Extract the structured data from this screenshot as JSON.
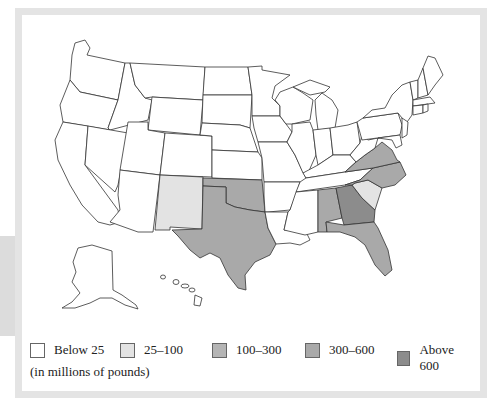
{
  "map": {
    "title": "",
    "units_note": "(in millions of pounds)",
    "fill_colors": {
      "below_25": "#ffffff",
      "25_100": "#e3e3e3",
      "100_300": "#b5b5b5",
      "300_600": "#a9a9a9",
      "above_600": "#8c8c8c"
    },
    "state_categories": {
      "New Mexico": "25-100",
      "South Carolina": "25-100",
      "Texas": "300-600",
      "Oklahoma": "300-600",
      "Alabama": "300-600",
      "Florida": "300-600",
      "North Carolina": "300-600",
      "Virginia": "300-600",
      "Georgia": "Above 600",
      "all_other_states": "Below 25"
    }
  },
  "legend": {
    "items": [
      {
        "label": "Below 25",
        "color": "#ffffff"
      },
      {
        "label": "25–100",
        "color": "#e3e3e3"
      },
      {
        "label": "100–300",
        "color": "#b5b5b5"
      },
      {
        "label": "300–600",
        "color": "#a9a9a9"
      },
      {
        "label": "Above 600",
        "color": "#8c8c8c"
      }
    ]
  }
}
